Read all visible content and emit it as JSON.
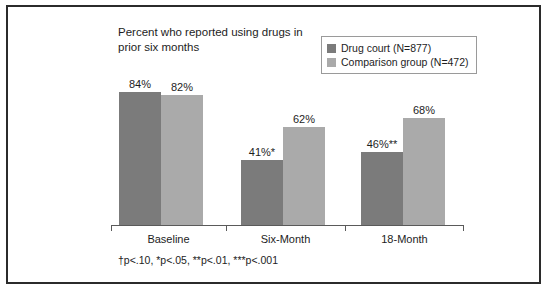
{
  "chart_data": {
    "type": "bar",
    "title": "Percent who reported using drugs in\nprior six months",
    "xlabel": "",
    "ylabel": "",
    "ylim": [
      0,
      100
    ],
    "grid": false,
    "legend_position": "top-right",
    "categories": [
      "Baseline",
      "Six-Month",
      "18-Month"
    ],
    "series": [
      {
        "name": "Drug court (N=877)",
        "color": "#7b7b7b",
        "values": [
          84,
          41,
          46
        ],
        "value_labels": [
          "84%",
          "41%*",
          "46%**"
        ]
      },
      {
        "name": "Comparison group (N=472)",
        "color": "#aaaaaa",
        "values": [
          82,
          62,
          68
        ],
        "value_labels": [
          "82%",
          "62%",
          "68%"
        ]
      }
    ],
    "footnote": "†p<.10,  *p<.05, **p<.01, ***p<.001"
  },
  "legend": {
    "items": [
      {
        "label": "Drug court (N=877)",
        "color": "#7b7b7b"
      },
      {
        "label": "Comparison group (N=472)",
        "color": "#aaaaaa"
      }
    ]
  }
}
